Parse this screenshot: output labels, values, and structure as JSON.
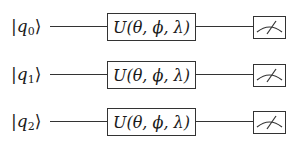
{
  "diagram": {
    "type": "quantum-circuit",
    "qubits": [
      {
        "ket_symbol": "q",
        "index": "0",
        "gate": "U(θ, ϕ, λ)",
        "measure_icon": "meter-icon"
      },
      {
        "ket_symbol": "q",
        "index": "1",
        "gate": "U(θ, ϕ, λ)",
        "measure_icon": "meter-icon"
      },
      {
        "ket_symbol": "q",
        "index": "2",
        "gate": "U(θ, ϕ, λ)",
        "measure_icon": "meter-icon"
      }
    ],
    "ket_open": "|",
    "ket_close": "⟩"
  }
}
